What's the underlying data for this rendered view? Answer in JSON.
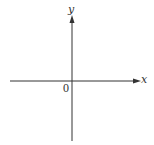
{
  "diagram": {
    "type": "cartesian-axes",
    "labels": {
      "x_axis": "x",
      "y_axis": "y",
      "origin": "0"
    },
    "colors": {
      "axis": "#333333",
      "background": "#ffffff"
    }
  }
}
